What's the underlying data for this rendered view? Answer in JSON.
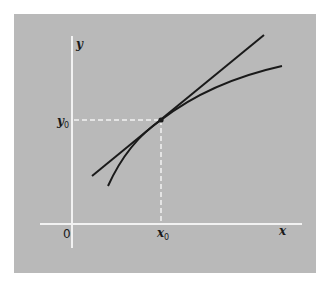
{
  "diagram": {
    "title": "",
    "labels": {
      "y_axis": "y",
      "x_axis": "x",
      "origin": "0",
      "y0_base": "y",
      "y0_sub": "0",
      "x0_base": "x",
      "x0_sub": "0"
    },
    "colors": {
      "background": "#ffffff",
      "panel": "#b9b9b9",
      "axes": "#f2f2f2",
      "curve": "#1a1a1a",
      "dashed": "#f2f2f2"
    },
    "point": {
      "x0_px": 161,
      "y0_px": 120
    },
    "elements": [
      "y-axis",
      "x-axis",
      "curve",
      "tangent-line",
      "tangent-point",
      "dashed-guide-to-y0",
      "dashed-guide-to-x0"
    ]
  }
}
